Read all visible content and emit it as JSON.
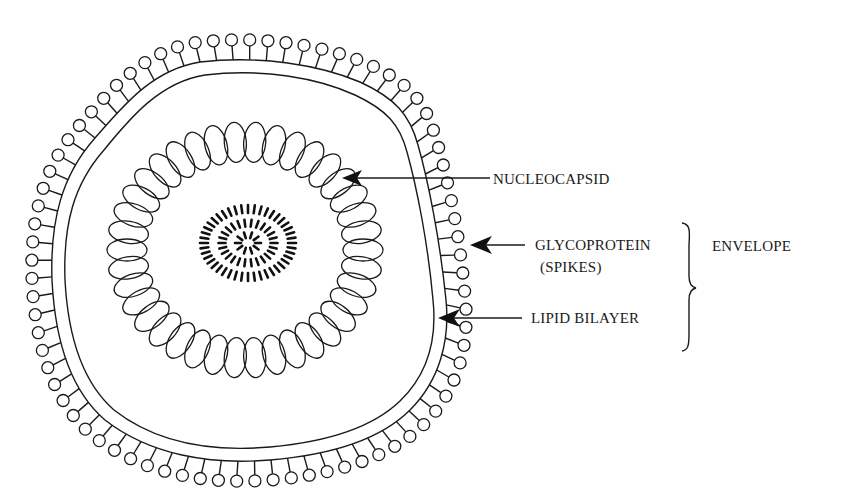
{
  "figure": {
    "background": "#ffffff",
    "ink_color": "#1a1a1a"
  },
  "labels": {
    "nucleocapsid": "NUCLEOCAPSID",
    "glycoprotein_line1": "GLYCOPROTEIN",
    "glycoprotein_line2": "(SPIKES)",
    "lipid_bilayer": "LIPID BILAYER",
    "envelope": "ENVELOPE"
  },
  "components": [
    {
      "name": "nucleocapsid",
      "pointer": "arrow",
      "description": "ring of capsomere ellipses"
    },
    {
      "name": "glycoprotein spikes",
      "pointer": "arrow",
      "group": "envelope"
    },
    {
      "name": "lipid bilayer",
      "pointer": "arrow",
      "group": "envelope"
    },
    {
      "name": "nucleic acid core",
      "pointer": "none"
    }
  ],
  "geometry": {
    "capsid_center": [
      245,
      250
    ],
    "capsid_rx": 118,
    "capsid_ry": 108,
    "capsid_units": 38,
    "core_center": [
      248,
      243
    ]
  }
}
